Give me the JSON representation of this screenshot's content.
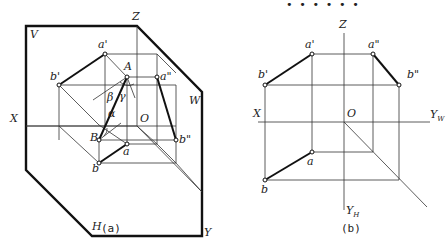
{
  "header_dots": "• • • • • •",
  "figure_a": {
    "caption": "(a)",
    "planes": {
      "V": "V",
      "W": "W",
      "H": "H"
    },
    "axes": {
      "X": "X",
      "Y": "Y",
      "Z": "Z",
      "O": "O"
    },
    "points": {
      "A": "A",
      "B": "B",
      "a": "a",
      "b": "b",
      "a_prime": "a'",
      "b_prime": "b'",
      "a_dprime": "a\"",
      "b_dprime": "b\""
    },
    "angles": {
      "alpha": "α",
      "beta": "β",
      "gamma": "γ"
    }
  },
  "figure_b": {
    "caption": "(b)",
    "axes": {
      "X": "X",
      "Z": "Z",
      "O": "O",
      "Y_W": "Y",
      "Y_W_sub": "W",
      "Y_H": "Y",
      "Y_H_sub": "H"
    },
    "points": {
      "a": "a",
      "b": "b",
      "a_prime": "a'",
      "b_prime": "b'",
      "a_dprime": "a\"",
      "b_dprime": "b\""
    }
  }
}
